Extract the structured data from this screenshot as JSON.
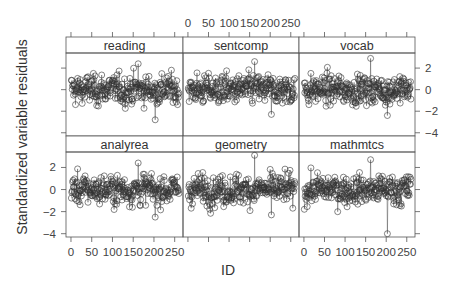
{
  "chart_data": {
    "type": "scatter",
    "subtype": "lattice trellis, points joined by vertical lines (type='h'-like) ",
    "title": "",
    "xlabel": "ID",
    "ylabel": "Standardized variable residuals",
    "layout": {
      "rows": 2,
      "cols": 3,
      "strip_position": "top"
    },
    "x_ticks": [
      0,
      50,
      100,
      150,
      200,
      250
    ],
    "y_ticks": [
      2,
      0,
      -2,
      -4
    ],
    "xlim": [
      -12,
      270
    ],
    "ylim": [
      -4.3,
      3.4
    ],
    "grid": false,
    "panels": [
      {
        "name": "reading",
        "row": 0,
        "col": 0,
        "y_range_approx": [
          -2.8,
          2.4
        ]
      },
      {
        "name": "sentcomp",
        "row": 0,
        "col": 1,
        "y_range_approx": [
          -2.3,
          2.6
        ]
      },
      {
        "name": "vocab",
        "row": 0,
        "col": 2,
        "y_range_approx": [
          -2.4,
          2.9
        ]
      },
      {
        "name": "analyrea",
        "row": 1,
        "col": 0,
        "y_range_approx": [
          -2.5,
          2.4
        ]
      },
      {
        "name": "geometry",
        "row": 1,
        "col": 1,
        "y_range_approx": [
          -2.3,
          3.1
        ]
      },
      {
        "name": "mathmtcs",
        "row": 1,
        "col": 2,
        "y_range_approx": [
          -4.0,
          2.7
        ]
      }
    ],
    "n_points_per_panel": 260
  },
  "axes": {
    "top_x_labels": [
      "0",
      "50",
      "100",
      "150",
      "200",
      "250"
    ],
    "bottom_x_labels": [
      "0",
      "50",
      "100",
      "150",
      "200",
      "250"
    ],
    "right_y_labels": [
      "2",
      "0",
      "−2",
      "−4"
    ],
    "left_y_labels": [
      "2",
      "0",
      "−2",
      "−4"
    ]
  },
  "colors": {
    "axis": "#555555",
    "points": "#333333",
    "strip_bg": "#ffffff"
  }
}
